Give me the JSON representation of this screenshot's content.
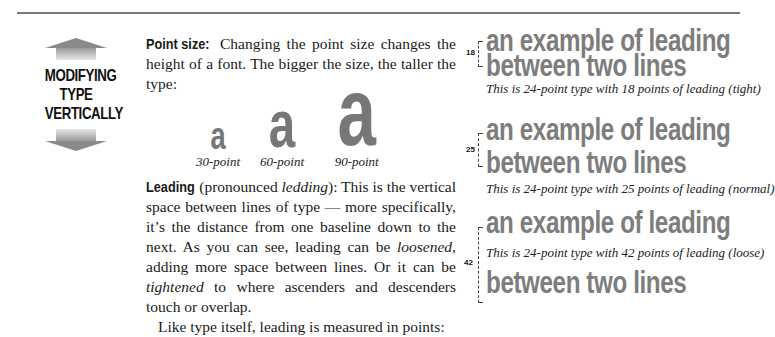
{
  "sidebar": {
    "title_lines": [
      "MODIFYING",
      "TYPE",
      "VERTICALLY"
    ]
  },
  "point_size": {
    "lead": "Point size:",
    "text": " Changing the point size changes the height of a font. The bigger the size, the taller the type:",
    "specimens": [
      {
        "glyph": "a",
        "caption": "30-point"
      },
      {
        "glyph": "a",
        "caption": "60-point"
      },
      {
        "glyph": "a",
        "caption": "90-point"
      }
    ]
  },
  "leading": {
    "lead": "Leading",
    "text_1": " (pronounced ",
    "pronounced": "ledding",
    "text_2": "): This is the vertical space between lines of type — more specifically, it’s the distance from one baseline down to the next.  As you can see, leading can be ",
    "loosened": "loosened,",
    "text_3": " adding more space between lines. Or it can be ",
    "tightened": "tightened",
    "text_4": " to where ascenders and descenders touch or overlap.",
    "closing": "Like type itself, leading is measured in points:"
  },
  "examples": [
    {
      "line_1": "an example of leading",
      "line_2": "between two lines",
      "leading_value": "18",
      "caption": "This is 24-point type with 18 points of leading (tight)"
    },
    {
      "line_1": "an example of leading",
      "line_2": "between two lines",
      "leading_value": "25",
      "caption": "This is 24-point type with 25 points of leading (normal)"
    },
    {
      "line_1": "an example of leading",
      "line_2": "between two lines",
      "leading_value": "42",
      "caption": "This is 24-point type with 42 points of leading (loose)"
    }
  ]
}
